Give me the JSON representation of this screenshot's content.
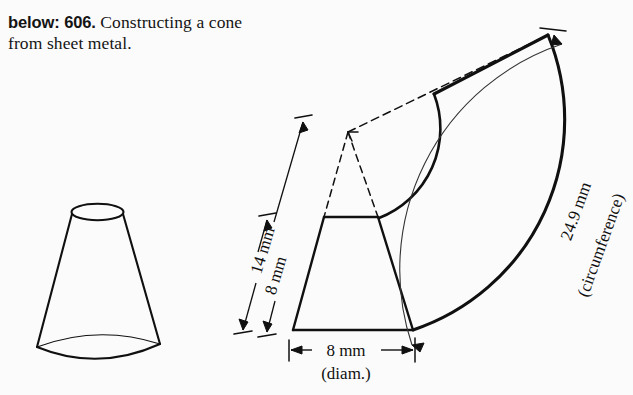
{
  "caption": {
    "lead": "below: 606.",
    "body": " Constructing a cone from sheet metal."
  },
  "figure": {
    "labels": {
      "height_outer": "14 mm",
      "height_inner": "8 mm",
      "diameter": "8 mm",
      "diameter_note": "(diam.)",
      "circumference": "24.9 mm",
      "circumference_note": "(circumference)"
    }
  },
  "colors": {
    "background": "#fbfbfb",
    "ink": "#101010",
    "thin_line": "#333333"
  }
}
